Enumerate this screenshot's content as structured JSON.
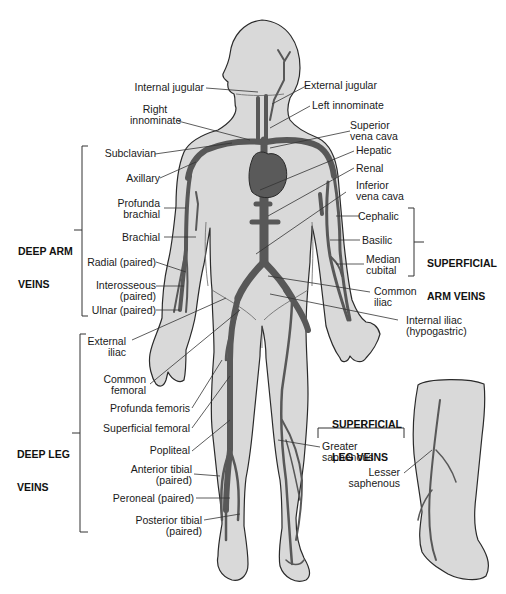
{
  "diagram": {
    "type": "anatomical-illustration",
    "colors": {
      "body_fill": "#d9d9d9",
      "body_outline": "#2a2a2a",
      "vein": "#585858",
      "heart": "#5a5a5a",
      "leader_line": "#333333",
      "text": "#1a1a1a"
    },
    "labels": {
      "internal_jugular": "Internal jugular",
      "external_jugular": "External jugular",
      "right_innominate_1": "Right",
      "right_innominate_2": "innominate",
      "left_innominate": "Left innominate",
      "superior_vena_cava_1": "Superior",
      "superior_vena_cava_2": "vena cava",
      "subclavian": "Subclavian",
      "hepatic": "Hepatic",
      "axillary": "Axillary",
      "renal": "Renal",
      "inferior_vena_cava_1": "Inferior",
      "inferior_vena_cava_2": "vena cava",
      "profunda_brachial_1": "Profunda",
      "profunda_brachial_2": "brachial",
      "cephalic": "Cephalic",
      "brachial": "Brachial",
      "basilic": "Basilic",
      "median_cubital_1": "Median",
      "median_cubital_2": "cubital",
      "radial": "Radial (paired)",
      "interosseous_1": "Interosseous",
      "interosseous_2": "(paired)",
      "common_iliac_1": "Common",
      "common_iliac_2": "iliac",
      "ulnar": "Ulnar (paired)",
      "internal_iliac_1": "Internal iliac",
      "internal_iliac_2": "(hypogastric)",
      "external_iliac_1": "External",
      "external_iliac_2": "iliac",
      "common_femoral_1": "Common",
      "common_femoral_2": "femoral",
      "profunda_femoris": "Profunda femoris",
      "superficial_femoral": "Superficial femoral",
      "popliteal": "Popliteal",
      "greater_saphenous_1": "Greater",
      "greater_saphenous_2": "saphenous",
      "lesser_saphenous_1": "Lesser",
      "lesser_saphenous_2": "saphenous",
      "anterior_tibial_1": "Anterior tibial",
      "anterior_tibial_2": "(paired)",
      "peroneal": "Peroneal (paired)",
      "posterior_tibial_1": "Posterior tibial",
      "posterior_tibial_2": "(paired)"
    },
    "groups": {
      "deep_arm_1": "DEEP ARM",
      "deep_arm_2": "VEINS",
      "superficial_arm_1": "SUPERFICIAL",
      "superficial_arm_2": "ARM VEINS",
      "deep_leg_1": "DEEP LEG",
      "deep_leg_2": "VEINS",
      "superficial_leg_1": "SUPERFICIAL",
      "superficial_leg_2": "LEG VEINS"
    }
  }
}
